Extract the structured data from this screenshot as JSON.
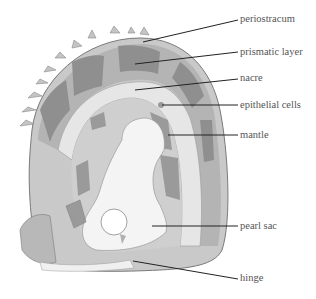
{
  "diagram": {
    "colors": {
      "background": "#ffffff",
      "shell_outer": "#c9c9c9",
      "prismatic_dark": "#8f8f8f",
      "prismatic_light": "#b4b4b4",
      "nacre": "#e6e6e6",
      "mantle_dark": "#9a9a9a",
      "mantle_light": "#cfcfcf",
      "pearl_sac": "#f4f4f4",
      "leader_line": "#222222",
      "label_text": "#555555"
    },
    "labels": [
      {
        "id": "periostracum",
        "text": "periostracum"
      },
      {
        "id": "prismatic-layer",
        "text": "prismatic layer"
      },
      {
        "id": "nacre",
        "text": "nacre"
      },
      {
        "id": "epithelial-cells",
        "text": "epithelial cells"
      },
      {
        "id": "mantle",
        "text": "mantle"
      },
      {
        "id": "pearl-sac",
        "text": "pearl sac"
      },
      {
        "id": "hinge",
        "text": "hinge"
      }
    ]
  }
}
